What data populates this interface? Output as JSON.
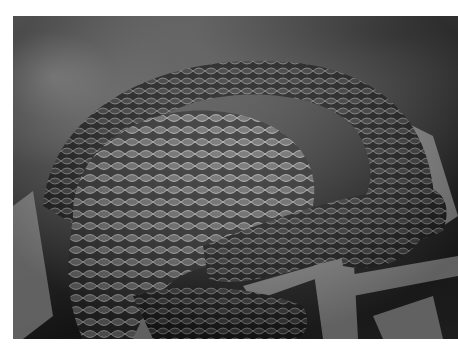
{
  "image": {
    "subject": "coiled dark snake with reticulated scales resting on leaf litter",
    "style": "grayscale photograph",
    "border_color": "#ffffff"
  }
}
